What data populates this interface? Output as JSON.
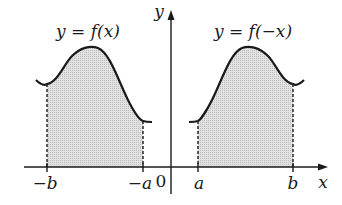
{
  "diagram": {
    "left_graph_label": "y = f(x)",
    "right_graph_label": "y = f(−x)",
    "y_axis_label": "y",
    "x_axis_label": "x",
    "origin_label": "0",
    "ticks": {
      "neg_b": "−b",
      "neg_a": "−a",
      "a": "a",
      "b": "b"
    },
    "colors": {
      "stroke": "#1a1a1a",
      "shade": "#d0d0d0",
      "background": "#ffffff"
    }
  }
}
